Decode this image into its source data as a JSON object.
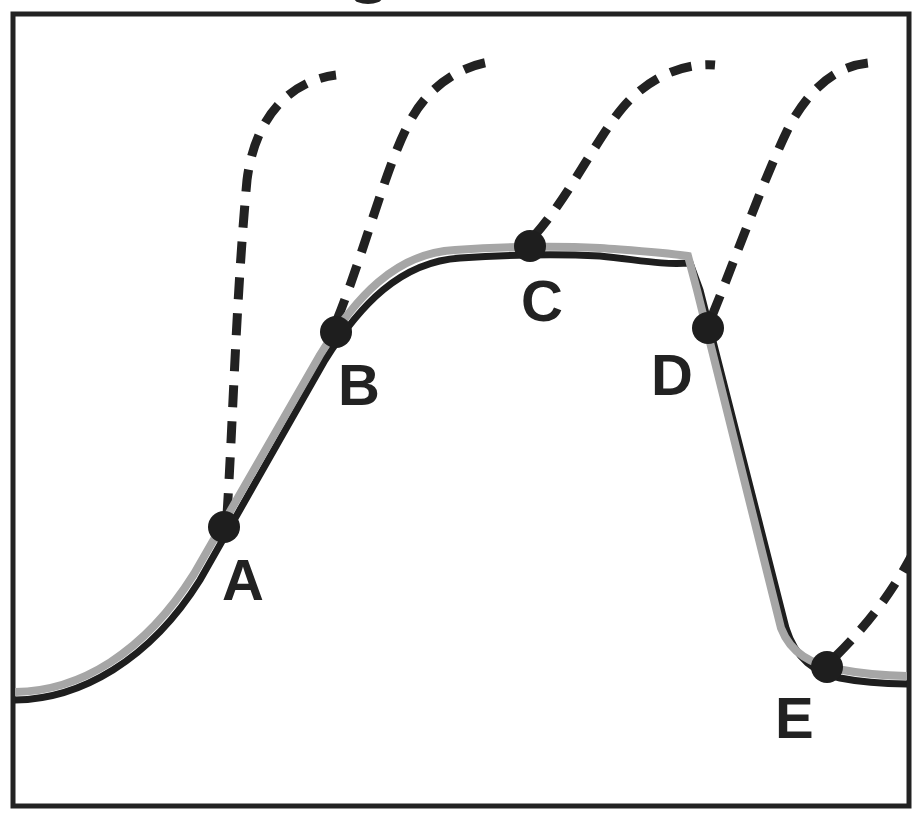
{
  "diagram": {
    "type": "curve-with-tangent-branches",
    "frame": {
      "x": 13,
      "y": 14,
      "width": 896,
      "height": 792,
      "stroke": "#222222"
    },
    "colors": {
      "main_curve": "#1e1e1e",
      "main_curve_highlight": "#a6a6a6",
      "dashed_branch": "#222222",
      "point": "#1e1e1e",
      "label": "#222222"
    },
    "points": [
      {
        "id": "A",
        "label": "A",
        "x": 224,
        "y": 527,
        "label_x": 222,
        "label_y": 600
      },
      {
        "id": "B",
        "label": "B",
        "x": 336,
        "y": 332,
        "label_x": 338,
        "label_y": 405
      },
      {
        "id": "C",
        "label": "C",
        "x": 530,
        "y": 246,
        "label_x": 521,
        "label_y": 321
      },
      {
        "id": "D",
        "label": "D",
        "x": 708,
        "y": 328,
        "label_x": 651,
        "label_y": 395
      },
      {
        "id": "E",
        "label": "E",
        "x": 827,
        "y": 667,
        "label_x": 775,
        "label_y": 738
      }
    ],
    "branches": [
      {
        "from": "A",
        "to_x": 336,
        "to_y": 75
      },
      {
        "from": "B",
        "to_x": 497,
        "to_y": 61
      },
      {
        "from": "C",
        "to_x": 715,
        "to_y": 65
      },
      {
        "from": "D",
        "to_x": 868,
        "to_y": 63
      },
      {
        "from": "E",
        "to_x": 909,
        "to_y": 560
      }
    ]
  }
}
